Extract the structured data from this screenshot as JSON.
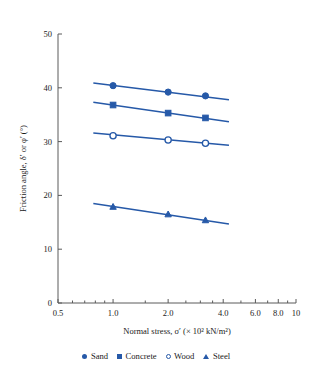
{
  "chart_data": {
    "type": "line",
    "title": "",
    "xlabel": "Normal stress, σ′ (× 10² kN/m²)",
    "ylabel": "Friction angle, δ′ or φ′ (°)",
    "xscale": "log",
    "xlim": [
      0.5,
      10
    ],
    "ylim": [
      0,
      50
    ],
    "xticks": [
      0.5,
      1.0,
      2.0,
      4.0,
      6.0,
      8.0,
      10
    ],
    "xtick_labels": [
      "0.5",
      "1.0",
      "2.0",
      "4.0",
      "6.0",
      "8.0",
      "10"
    ],
    "yticks": [
      0,
      10,
      20,
      30,
      40,
      50
    ],
    "ytick_labels": [
      "0",
      "10",
      "20",
      "30",
      "40",
      "50"
    ],
    "grid": false,
    "legend_position": "bottom",
    "accent_color": "#2659a8",
    "axis_color": "#5a5a5a",
    "series": [
      {
        "name": "Sand",
        "marker": "filled-circle",
        "x": [
          1.0,
          2.0,
          3.2
        ],
        "values": [
          40.4,
          39.2,
          38.5
        ],
        "line_x": [
          0.78,
          4.3
        ],
        "line_y": [
          40.9,
          37.8
        ]
      },
      {
        "name": "Concrete",
        "marker": "filled-square",
        "x": [
          1.0,
          2.0,
          3.2
        ],
        "values": [
          36.8,
          35.3,
          34.4
        ],
        "line_x": [
          0.78,
          4.3
        ],
        "line_y": [
          37.3,
          33.7
        ]
      },
      {
        "name": "Wood",
        "marker": "open-circle",
        "x": [
          1.0,
          2.0,
          3.2
        ],
        "values": [
          31.1,
          30.3,
          29.7
        ],
        "line_x": [
          0.78,
          4.3
        ],
        "line_y": [
          31.6,
          29.3
        ]
      },
      {
        "name": "Steel",
        "marker": "filled-triangle",
        "x": [
          1.0,
          2.0,
          3.2
        ],
        "values": [
          17.9,
          16.5,
          15.4
        ],
        "line_x": [
          0.78,
          4.3
        ],
        "line_y": [
          18.5,
          14.7
        ]
      }
    ]
  },
  "legend": {
    "items": [
      {
        "label": "Sand",
        "marker": "filled-circle"
      },
      {
        "label": "Concrete",
        "marker": "filled-square"
      },
      {
        "label": "Wood",
        "marker": "open-circle"
      },
      {
        "label": "Steel",
        "marker": "filled-triangle"
      }
    ]
  }
}
